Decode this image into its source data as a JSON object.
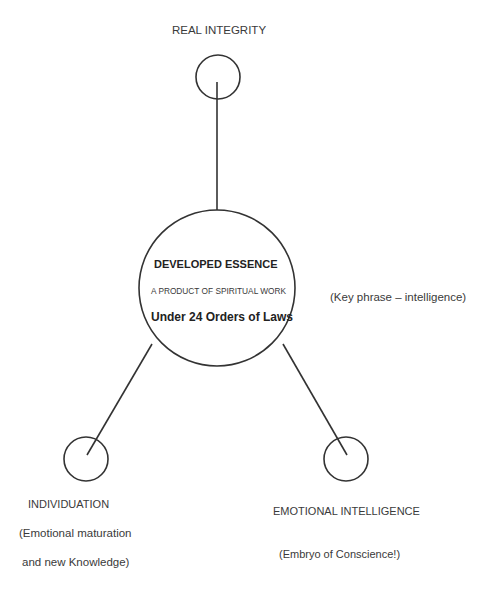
{
  "diagram": {
    "stroke_color": "#333333",
    "nodes": {
      "top": {
        "label": "REAL INTEGRITY",
        "cx": 218,
        "cy": 77,
        "r": 22
      },
      "center": {
        "cx": 217,
        "cy": 288,
        "r": 78,
        "title": "DEVELOPED ESSENCE",
        "subtitle": "A PRODUCT OF SPIRITUAL WORK",
        "line3": "Under 24 Orders of Laws"
      },
      "left": {
        "cx": 86,
        "cy": 459,
        "r": 22,
        "label": "INDIVIDUATION",
        "note_line1": "(Emotional maturation",
        "note_line2": "and new Knowledge)"
      },
      "right": {
        "cx": 346,
        "cy": 459,
        "r": 22,
        "label": "EMOTIONAL INTELLIGENCE",
        "note": "(Embryo of Conscience!)"
      }
    },
    "side_note": "(Key phrase – intelligence)",
    "connectors": [
      {
        "x1": 217,
        "y1": 82,
        "x2": 217,
        "y2": 210
      },
      {
        "x1": 152,
        "y1": 344,
        "x2": 87,
        "y2": 455
      },
      {
        "x1": 283,
        "y1": 344,
        "x2": 347,
        "y2": 455
      }
    ]
  }
}
